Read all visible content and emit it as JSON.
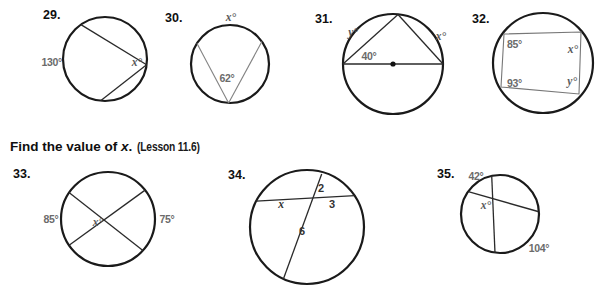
{
  "colors": {
    "background": "#ffffff",
    "circle_stroke": "#1a1a1a",
    "label_gray": "#6b6b6b",
    "heading_black": "#0f0f0f"
  },
  "heading": {
    "prefix": "Find the value of ",
    "variable": "x",
    "suffix": ".",
    "lesson": "(Lesson 11.6)"
  },
  "problems": {
    "p29": {
      "number": "29.",
      "arc": "130°",
      "vertex": "x°"
    },
    "p30": {
      "number": "30.",
      "arc": "x°",
      "vertex": "62°"
    },
    "p31": {
      "number": "31.",
      "left_arc": "y°",
      "right_arc": "x°",
      "vertex": "40°"
    },
    "p32": {
      "number": "32.",
      "top_left": "85°",
      "top_right": "x°",
      "bottom_left": "93°",
      "bottom_right": "y°"
    },
    "p33": {
      "number": "33.",
      "left_arc": "85°",
      "vertex": "x°",
      "right_arc": "75°"
    },
    "p34": {
      "number": "34.",
      "top_segment": "2",
      "left_segment": "x",
      "right_segment": "3",
      "bottom_segment": "6"
    },
    "p35": {
      "number": "35.",
      "top_arc": "42°",
      "vertex": "x°",
      "bottom_arc": "104°"
    }
  }
}
